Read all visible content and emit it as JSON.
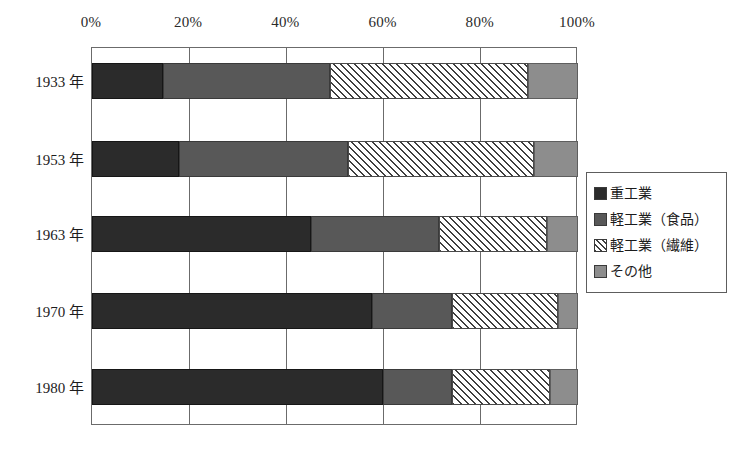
{
  "chart_data": {
    "type": "bar",
    "subtype": "stacked-horizontal-100-percent",
    "title": "",
    "subtitle": "",
    "xlabel": "",
    "ylabel": "",
    "xlim": [
      0,
      100
    ],
    "grid": true,
    "legend_position": "right",
    "axis_position": "top",
    "categories": [
      "1933 年",
      "1953 年",
      "1963 年",
      "1970 年",
      "1980 年"
    ],
    "xtick_labels": [
      "0%",
      "20%",
      "40%",
      "60%",
      "80%",
      "100%"
    ],
    "xtick_values": [
      0,
      20,
      40,
      60,
      80,
      100
    ],
    "series": [
      {
        "name": "重工業",
        "key": "heavy",
        "color": "#2b2b2b",
        "pattern": "solid-dark",
        "values": [
          14.7,
          17.8,
          45.0,
          57.7,
          59.8
        ]
      },
      {
        "name": "軽工業（食品）",
        "key": "food",
        "color": "#585858",
        "pattern": "solid-mid",
        "values": [
          34.3,
          34.9,
          26.4,
          16.3,
          14.2
        ]
      },
      {
        "name": "軽工業（繊維）",
        "key": "textile",
        "color": "#ffffff",
        "pattern": "diagonal-hatch",
        "values": [
          40.8,
          38.3,
          22.2,
          21.8,
          20.3
        ]
      },
      {
        "name": "その他",
        "key": "other",
        "color": "#8d8d8d",
        "pattern": "solid-light",
        "values": [
          10.2,
          9.0,
          6.4,
          4.2,
          5.7
        ]
      }
    ]
  },
  "legend": {
    "entries": [
      {
        "label": "重工業",
        "swatch": "heavy"
      },
      {
        "label": "軽工業（食品）",
        "swatch": "food"
      },
      {
        "label": "軽工業（繊維）",
        "swatch": "textile"
      },
      {
        "label": "その他",
        "swatch": "other"
      }
    ]
  },
  "colors": {
    "heavy": "#2b2b2b",
    "food": "#585858",
    "textile_hatch": "#3f3f3f",
    "other": "#8d8d8d",
    "frame": "#6b6b6b",
    "background": "#ffffff",
    "text": "#1c1c1c"
  }
}
